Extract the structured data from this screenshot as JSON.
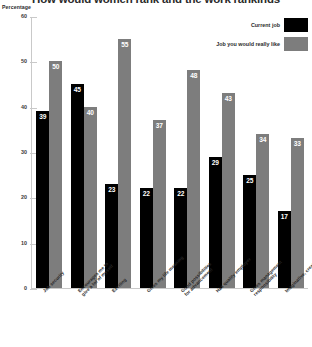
{
  "chart_data": {
    "type": "bar",
    "title": "How would women rank and the work rankings",
    "ylabel": "Percentage",
    "xlabel": "",
    "ylim": [
      0,
      60
    ],
    "yticks": [
      0,
      10,
      20,
      30,
      40,
      50,
      60
    ],
    "grid": false,
    "legend_position": "top-right",
    "categories": [
      "Job security",
      "Encourages me to give a lot of myself",
      "Exciting",
      "Gives my life meaning",
      "Good possibilities for advancement",
      "Has quality employer",
      "Gives management responsibility",
      "Imaginative, creative work"
    ],
    "categories_lines": [
      [
        "Job security",
        ""
      ],
      [
        "Encourages me to",
        "give a lot of myself"
      ],
      [
        "Exciting",
        ""
      ],
      [
        "Gives my life meaning",
        ""
      ],
      [
        "Good possibilities",
        "for advancement"
      ],
      [
        "Has quality employer",
        ""
      ],
      [
        "Gives management",
        "responsibility"
      ],
      [
        "Imaginative, creative work",
        ""
      ]
    ],
    "series": [
      {
        "name": "Current job",
        "color": "#000000",
        "values": [
          39,
          45,
          23,
          22,
          22,
          29,
          25,
          17
        ]
      },
      {
        "name": "Job you would really like",
        "color": "#7d7d7d",
        "values": [
          50,
          40,
          55,
          37,
          48,
          43,
          34,
          33
        ]
      }
    ]
  },
  "axis": {
    "caption": "Percentage"
  }
}
